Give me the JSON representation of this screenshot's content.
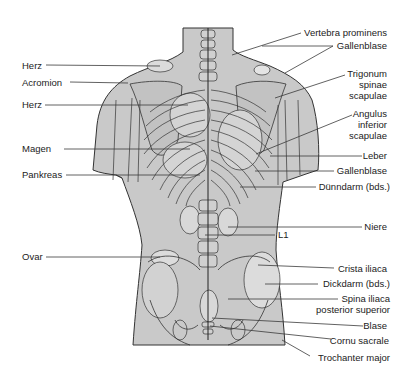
{
  "figure": {
    "colors": {
      "body_fill": "#c9c9c9",
      "organ_fill": "#dcdcdc",
      "outline": "#333333",
      "leader": "#3a3a3a",
      "text": "#222222",
      "background": "#ffffff"
    }
  },
  "labels_left": [
    {
      "text": "Herz",
      "x": 22,
      "y": 60,
      "line_to": [
        160,
        66
      ]
    },
    {
      "text": "Acromion",
      "x": 22,
      "y": 77,
      "line_to": [
        128,
        83
      ]
    },
    {
      "text": "Herz",
      "x": 22,
      "y": 99,
      "line_to": [
        188,
        105
      ]
    },
    {
      "text": "Magen",
      "x": 22,
      "y": 143,
      "line_to": [
        190,
        149
      ]
    },
    {
      "text": "Pankreas",
      "x": 22,
      "y": 169,
      "line_to": [
        200,
        175
      ]
    },
    {
      "text": "Ovar",
      "x": 22,
      "y": 251,
      "line_to": [
        160,
        257
      ]
    }
  ],
  "labels_right": [
    {
      "lines": [
        "Vertebra prominens"
      ],
      "right": 387,
      "y": 27,
      "line_from": [
        300,
        33
      ],
      "line_to": [
        232,
        55
      ]
    },
    {
      "lines": [
        "Gallenblase"
      ],
      "right": 387,
      "y": 40,
      "line_from": [
        333,
        46
      ],
      "line_to": [
        262,
        46
      ]
    },
    {
      "lines": [
        "Trigonum",
        "spinae",
        "scapulae"
      ],
      "right": 387,
      "y": 68,
      "line_from": [
        342,
        75
      ],
      "line_to": [
        275,
        98
      ]
    },
    {
      "lines": [
        "Angulus",
        "inferior",
        "scapulae"
      ],
      "right": 387,
      "y": 108,
      "line_from": [
        355,
        115
      ],
      "line_to": [
        256,
        154
      ]
    },
    {
      "lines": [
        "Leber"
      ],
      "right": 387,
      "y": 150,
      "line_from": [
        360,
        156
      ],
      "line_to": [
        270,
        156
      ]
    },
    {
      "lines": [
        "Gallenblase"
      ],
      "right": 387,
      "y": 165,
      "line_from": [
        334,
        171
      ],
      "line_to": [
        255,
        171
      ]
    },
    {
      "lines": [
        "Dünndarm (bds.)"
      ],
      "right": 390,
      "y": 181,
      "line_from": [
        315,
        187
      ],
      "line_to": [
        240,
        187
      ]
    },
    {
      "lines": [
        "Niere"
      ],
      "right": 387,
      "y": 221,
      "line_from": [
        360,
        227
      ],
      "line_to": [
        228,
        227
      ]
    },
    {
      "lines": [
        "L1"
      ],
      "right": 290,
      "y": 229,
      "line_from": [
        276,
        235
      ],
      "line_to": [
        205,
        235
      ]
    },
    {
      "lines": [
        "Crista iliaca"
      ],
      "right": 387,
      "y": 263,
      "line_from": [
        334,
        268
      ],
      "line_to": [
        258,
        265
      ]
    },
    {
      "lines": [
        "Dickdarm (bds.)"
      ],
      "right": 390,
      "y": 278,
      "line_from": [
        318,
        284
      ],
      "line_to": [
        265,
        284
      ]
    },
    {
      "lines": [
        "Spina iliaca",
        "posterior superior"
      ],
      "right": 390,
      "y": 293,
      "line_from": [
        338,
        299
      ],
      "line_to": [
        228,
        299
      ]
    },
    {
      "lines": [
        "Blase"
      ],
      "right": 387,
      "y": 320,
      "line_from": [
        360,
        326
      ],
      "line_to": [
        212,
        318
      ]
    },
    {
      "lines": [
        "Cornu sacrale"
      ],
      "right": 389,
      "y": 335,
      "line_from": [
        331,
        339
      ],
      "line_to": [
        210,
        326
      ]
    },
    {
      "lines": [
        "Trochanter major"
      ],
      "right": 390,
      "y": 352,
      "line_from": [
        310,
        356
      ],
      "line_to": [
        282,
        340
      ]
    }
  ]
}
